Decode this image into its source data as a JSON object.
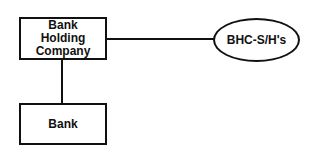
{
  "diagram": {
    "type": "org-structure",
    "nodes": {
      "holding_company": {
        "shape": "rectangle",
        "lines": [
          "Bank",
          "Holding",
          "Company"
        ]
      },
      "bank": {
        "shape": "rectangle",
        "label": "Bank"
      },
      "shareholders": {
        "shape": "ellipse",
        "label": "BHC-S/H's"
      }
    },
    "edges": [
      {
        "from": "holding_company",
        "to": "shareholders",
        "orientation": "horizontal"
      },
      {
        "from": "holding_company",
        "to": "bank",
        "orientation": "vertical"
      }
    ],
    "colors": {
      "stroke": "#111111",
      "fill": "#ffffff",
      "text": "#111111"
    }
  }
}
